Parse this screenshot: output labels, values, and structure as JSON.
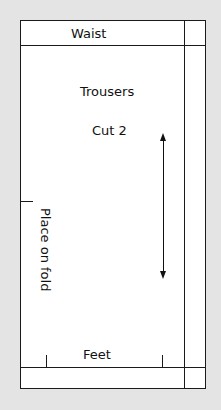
{
  "pattern": {
    "piece_name": "Trousers",
    "cut_instruction": "Cut 2",
    "top_edge_label": "Waist",
    "bottom_edge_label": "Feet",
    "fold_label": "Place on fold",
    "grainline": "double-headed-arrow"
  },
  "colors": {
    "background": "#e4e4e4",
    "paper": "#ffffff",
    "line": "#1a1a1a"
  }
}
